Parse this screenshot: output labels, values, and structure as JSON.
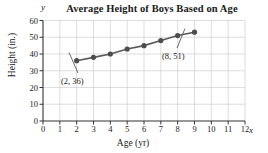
{
  "chart_data": {
    "type": "line",
    "title": "Average Height of Boys Based on Age",
    "xlabel": "Age (yr)",
    "ylabel": "Height (in.)",
    "x_axis_letter": "y",
    "y_axis_letter": "x",
    "xlim": [
      0,
      12
    ],
    "ylim": [
      0,
      60
    ],
    "xticks": [
      0,
      1,
      2,
      3,
      4,
      5,
      6,
      7,
      8,
      9,
      10,
      11,
      12
    ],
    "yticks": [
      0,
      10,
      20,
      30,
      40,
      50,
      60
    ],
    "grid": true,
    "legend": "none",
    "x": [
      2,
      3,
      4,
      5,
      6,
      7,
      8,
      9
    ],
    "values": [
      36,
      38,
      40,
      43,
      45,
      48,
      51,
      53
    ],
    "series": [
      {
        "name": "Average height of boys",
        "values": [
          36,
          38,
          40,
          43,
          45,
          48,
          51,
          53
        ]
      }
    ],
    "annotations": [
      {
        "label": "(2, 36)",
        "x": 2,
        "y": 36
      },
      {
        "label": "(8, 51)",
        "x": 8,
        "y": 51
      }
    ],
    "colors": {
      "line": "#595959",
      "marker": "#4d4d4d",
      "grid": "#c8c8c8",
      "axis": "#333333",
      "text": "#1a1a1a"
    }
  }
}
